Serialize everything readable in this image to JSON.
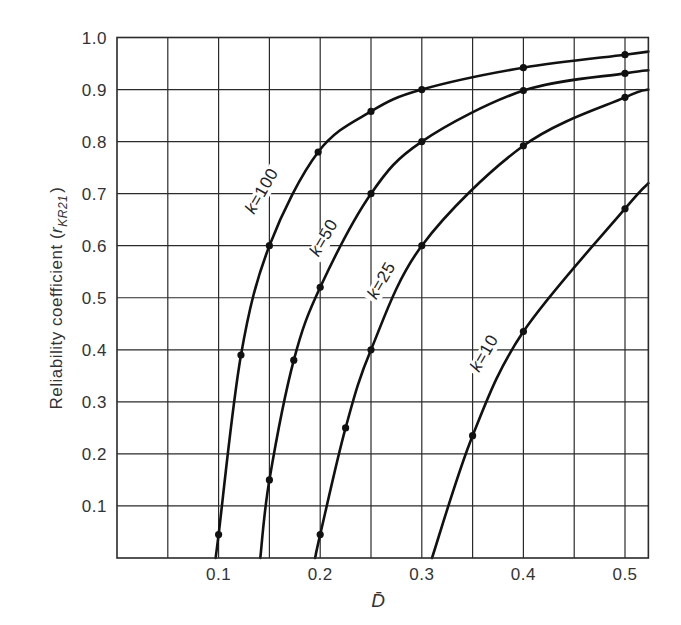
{
  "chart_data": {
    "type": "line",
    "title": "",
    "xlabel": "D̄",
    "ylabel": "Reliability coefficient (r_KR21)",
    "ylabel_parts": {
      "main": "Reliability coefficient (",
      "symbol": "r",
      "subscript": "KR21",
      "close": ")"
    },
    "xlim": [
      0,
      0.523
    ],
    "ylim": [
      0,
      1.0
    ],
    "grid": true,
    "legend": "none (inline curve labels)",
    "x_gridlines": [
      0.05,
      0.1,
      0.15,
      0.2,
      0.25,
      0.3,
      0.35,
      0.4,
      0.45,
      0.5
    ],
    "y_gridlines": [
      0.1,
      0.2,
      0.3,
      0.4,
      0.5,
      0.6,
      0.7,
      0.8,
      0.9,
      1.0
    ],
    "x_ticks": [
      {
        "value": 0.1,
        "label": "0.1"
      },
      {
        "value": 0.2,
        "label": "0.2"
      },
      {
        "value": 0.3,
        "label": "0.3"
      },
      {
        "value": 0.4,
        "label": "0.4"
      },
      {
        "value": 0.5,
        "label": "0.5"
      }
    ],
    "y_ticks": [
      {
        "value": 0.1,
        "label": "0.1"
      },
      {
        "value": 0.2,
        "label": "0.2"
      },
      {
        "value": 0.3,
        "label": "0.3"
      },
      {
        "value": 0.4,
        "label": "0.4"
      },
      {
        "value": 0.5,
        "label": "0.5"
      },
      {
        "value": 0.6,
        "label": "0.6"
      },
      {
        "value": 0.7,
        "label": "0.7"
      },
      {
        "value": 0.8,
        "label": "0.8"
      },
      {
        "value": 0.9,
        "label": "0.9"
      },
      {
        "value": 1.0,
        "label": "1.0"
      }
    ],
    "series": [
      {
        "name": "k=100",
        "label": "k=100",
        "label_pos": {
          "x": 0.147,
          "y": 0.7
        },
        "curve": [
          [
            0.097,
            0.0
          ],
          [
            0.1,
            0.045
          ],
          [
            0.122,
            0.39
          ],
          [
            0.15,
            0.6
          ],
          [
            0.198,
            0.78
          ],
          [
            0.25,
            0.858
          ],
          [
            0.3,
            0.9
          ],
          [
            0.4,
            0.942
          ],
          [
            0.5,
            0.967
          ],
          [
            0.523,
            0.973
          ]
        ],
        "points": [
          [
            0.1,
            0.045
          ],
          [
            0.122,
            0.39
          ],
          [
            0.15,
            0.6
          ],
          [
            0.198,
            0.78
          ],
          [
            0.25,
            0.858
          ],
          [
            0.3,
            0.9
          ],
          [
            0.4,
            0.942
          ],
          [
            0.5,
            0.967
          ]
        ]
      },
      {
        "name": "k=50",
        "label": "k=50",
        "label_pos": {
          "x": 0.208,
          "y": 0.61
        },
        "curve": [
          [
            0.141,
            0.0
          ],
          [
            0.15,
            0.15
          ],
          [
            0.174,
            0.38
          ],
          [
            0.2,
            0.52
          ],
          [
            0.25,
            0.7
          ],
          [
            0.3,
            0.8
          ],
          [
            0.4,
            0.898
          ],
          [
            0.5,
            0.931
          ],
          [
            0.523,
            0.937
          ]
        ],
        "points": [
          [
            0.15,
            0.15
          ],
          [
            0.174,
            0.38
          ],
          [
            0.2,
            0.52
          ],
          [
            0.25,
            0.7
          ],
          [
            0.3,
            0.8
          ],
          [
            0.4,
            0.898
          ],
          [
            0.5,
            0.931
          ]
        ]
      },
      {
        "name": "k=25",
        "label": "k=25",
        "label_pos": {
          "x": 0.265,
          "y": 0.528
        },
        "curve": [
          [
            0.195,
            0.0
          ],
          [
            0.2,
            0.045
          ],
          [
            0.225,
            0.25
          ],
          [
            0.25,
            0.4
          ],
          [
            0.3,
            0.6
          ],
          [
            0.4,
            0.792
          ],
          [
            0.5,
            0.885
          ],
          [
            0.523,
            0.9
          ]
        ],
        "points": [
          [
            0.2,
            0.045
          ],
          [
            0.225,
            0.25
          ],
          [
            0.25,
            0.4
          ],
          [
            0.3,
            0.6
          ],
          [
            0.4,
            0.792
          ],
          [
            0.5,
            0.885
          ]
        ]
      },
      {
        "name": "k=10",
        "label": "k=10",
        "label_pos": {
          "x": 0.366,
          "y": 0.388
        },
        "curve": [
          [
            0.31,
            0.0
          ],
          [
            0.35,
            0.235
          ],
          [
            0.4,
            0.435
          ],
          [
            0.5,
            0.671
          ],
          [
            0.523,
            0.72
          ]
        ],
        "points": [
          [
            0.35,
            0.235
          ],
          [
            0.4,
            0.435
          ],
          [
            0.5,
            0.671
          ]
        ]
      }
    ],
    "colors": {
      "curve": "#111111",
      "grid": "#2a2a2a",
      "text": "#333333",
      "background": "#ffffff"
    }
  }
}
